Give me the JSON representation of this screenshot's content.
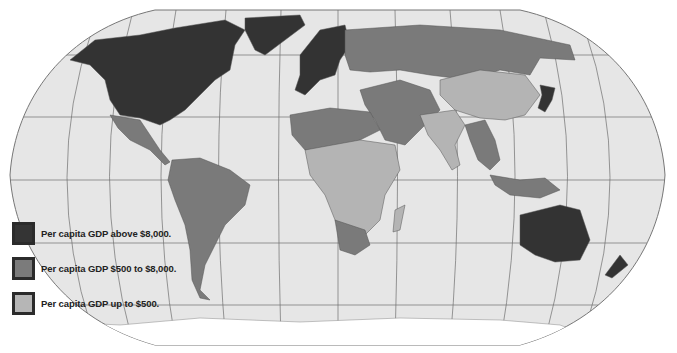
{
  "map": {
    "title": "World per capita GDP",
    "projection": "Robinson-like",
    "colors": {
      "ocean": "#e6e6e6",
      "border": "#555555",
      "graticule": "#6e6e6e",
      "high": "#333333",
      "mid": "#7a7a7a",
      "low": "#b4b4b4",
      "antarctica": "#ffffff"
    }
  },
  "legend": {
    "items": [
      {
        "label": "Per capita GDP above $8,000.",
        "color": "#343434"
      },
      {
        "label": "Per capita GDP $500 to $8,000.",
        "color": "#7b7b7b"
      },
      {
        "label": "Per capita GDP up to $500.",
        "color": "#b6b6b6"
      }
    ]
  }
}
